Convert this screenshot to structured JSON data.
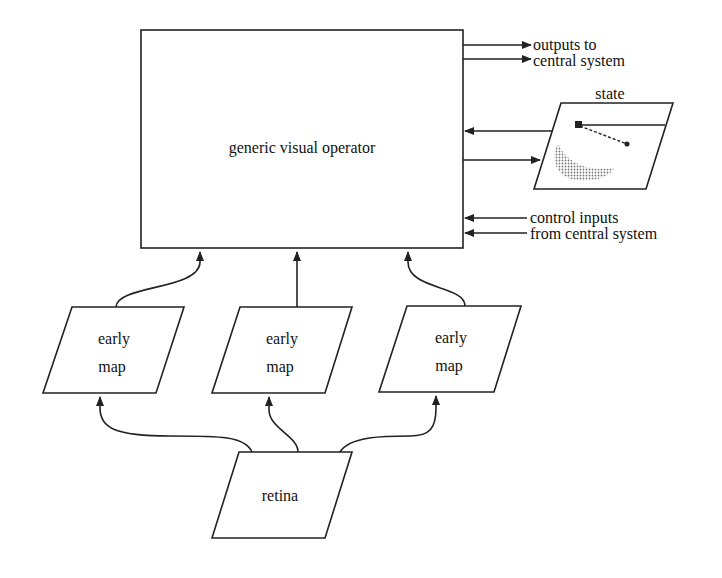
{
  "diagram": {
    "operator": {
      "label": "generic visual operator"
    },
    "outputs": {
      "line1": "outputs to",
      "line2": "central system"
    },
    "state": {
      "label": "state"
    },
    "controls": {
      "line1": "control inputs",
      "line2": "from central system"
    },
    "early_maps": [
      {
        "line1": "early",
        "line2": "map"
      },
      {
        "line1": "early",
        "line2": "map"
      },
      {
        "line1": "early",
        "line2": "map"
      }
    ],
    "retina": {
      "label": "retina"
    }
  },
  "colors": {
    "stroke": "#222222",
    "shading": "#9a9a9a",
    "background": "#ffffff"
  }
}
